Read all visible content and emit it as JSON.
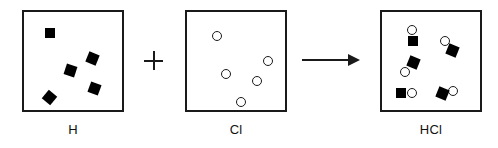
{
  "diagram": {
    "equation_text": "H + Cl -> HCl",
    "colors": {
      "background": "#ffffff",
      "stroke": "#1a1a1a",
      "hydrogen_fill": "#000000",
      "chlorine_fill": "#ffffff"
    },
    "operator": {
      "plus_symbol": "+",
      "arrow_symbol": "→"
    },
    "panels": [
      {
        "id": "panel-h",
        "label": "H",
        "box": {
          "x": 22,
          "y": 10,
          "w": 102,
          "h": 102
        },
        "label_pos": {
          "x": 22,
          "y": 122,
          "w": 102
        },
        "species": "hydrogen",
        "particle_count": 5,
        "particles": [
          {
            "kind": "square",
            "x": 45,
            "y": 28,
            "size": 10,
            "rotation": 0
          },
          {
            "kind": "square",
            "x": 87,
            "y": 53,
            "size": 11,
            "rotation": 22
          },
          {
            "kind": "square",
            "x": 65,
            "y": 65,
            "size": 11,
            "rotation": 18
          },
          {
            "kind": "square",
            "x": 89,
            "y": 83,
            "size": 11,
            "rotation": 20
          },
          {
            "kind": "square",
            "x": 44,
            "y": 92,
            "size": 11,
            "rotation": 40
          }
        ]
      },
      {
        "id": "panel-cl",
        "label": "Cl",
        "box": {
          "x": 185,
          "y": 10,
          "w": 102,
          "h": 102
        },
        "label_pos": {
          "x": 185,
          "y": 122,
          "w": 102
        },
        "species": "chlorine",
        "particle_count": 5,
        "particles": [
          {
            "kind": "circle",
            "x": 212,
            "y": 31,
            "size": 10
          },
          {
            "kind": "circle",
            "x": 263,
            "y": 56,
            "size": 10
          },
          {
            "kind": "circle",
            "x": 221,
            "y": 69,
            "size": 10
          },
          {
            "kind": "circle",
            "x": 252,
            "y": 76,
            "size": 10
          },
          {
            "kind": "circle",
            "x": 236,
            "y": 97,
            "size": 10
          }
        ]
      },
      {
        "id": "panel-hcl",
        "label": "HCl",
        "box": {
          "x": 380,
          "y": 10,
          "w": 102,
          "h": 102
        },
        "label_pos": {
          "x": 380,
          "y": 122,
          "w": 102
        },
        "species": "hydrogen-chloride",
        "particle_count": 5,
        "molecules": [
          {
            "name": "hcl-molecule-top-left",
            "orientation": "vertical-circle-above-square",
            "circle": {
              "x": 407,
              "y": 25,
              "size": 10
            },
            "square": {
              "x": 408,
              "y": 36,
              "size": 10,
              "rotation": 0
            }
          },
          {
            "name": "hcl-molecule-top-right",
            "orientation": "diagonal-circle-upper-left",
            "circle": {
              "x": 440,
              "y": 36,
              "size": 10
            },
            "square": {
              "x": 447,
              "y": 45,
              "size": 11,
              "rotation": 22
            }
          },
          {
            "name": "hcl-molecule-middle-left",
            "orientation": "diagonal-square-upper-right",
            "circle": {
              "x": 400,
              "y": 67,
              "size": 10
            },
            "square": {
              "x": 408,
              "y": 57,
              "size": 11,
              "rotation": 22
            }
          },
          {
            "name": "hcl-molecule-bottom-left",
            "orientation": "horizontal-square-left-circle-right",
            "square": {
              "x": 396,
              "y": 88,
              "size": 10,
              "rotation": 0
            },
            "circle": {
              "x": 407,
              "y": 88,
              "size": 10
            }
          },
          {
            "name": "hcl-molecule-bottom-right",
            "orientation": "horizontal-square-left-circle-right",
            "square": {
              "x": 437,
              "y": 88,
              "size": 11,
              "rotation": 22
            },
            "circle": {
              "x": 448,
              "y": 86,
              "size": 10
            }
          }
        ]
      }
    ],
    "plus": {
      "x": 144,
      "y": 51,
      "size": 19
    },
    "arrow": {
      "x": 302,
      "y": 54,
      "w": 58,
      "h": 12
    }
  }
}
